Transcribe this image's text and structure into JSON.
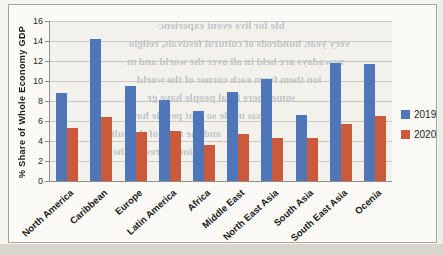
{
  "page": {
    "background": "#f6f4ef",
    "bottom_strip_color": "#d8d5cf",
    "card_background": "#fbfaf6",
    "card_border_color": "#a5a39b"
  },
  "chart_data": {
    "type": "bar",
    "title": "",
    "ylabel": "% Share  of  Whole Economy  GDP",
    "xlabel": "",
    "ylim": [
      0,
      16
    ],
    "yticks": [
      0,
      2,
      4,
      6,
      8,
      10,
      12,
      14,
      16
    ],
    "grid": true,
    "legend_position": "right",
    "categories": [
      "North America",
      "Caribbean",
      "Europe",
      "Latin America",
      "Africa",
      "Middle East",
      "North East Asia",
      "South Asia",
      "South East Asia",
      "Ocenia"
    ],
    "series": [
      {
        "name": "2019",
        "color": "#4f76b8",
        "values": [
          8.8,
          14.2,
          9.5,
          8.1,
          7.0,
          8.9,
          10.2,
          6.6,
          11.8,
          11.7
        ]
      },
      {
        "name": "2020",
        "color": "#cb5a3c",
        "values": [
          5.3,
          6.4,
          4.9,
          5.0,
          3.6,
          4.7,
          4.3,
          4.3,
          5.7,
          6.5
        ]
      }
    ],
    "colors": {
      "gridline": "#c9c7c0",
      "axis": "#8f8d86",
      "series_2019": "#4f76b8",
      "series_2020": "#cb5a3c"
    }
  },
  "legend": {
    "items": [
      {
        "label": "2019",
        "color": "#4f76b8"
      },
      {
        "label": "2020",
        "color": "#cb5a3c"
      }
    ]
  },
  "bleed_text": {
    "lines": [
      {
        "text": "ble for live event experienc",
        "top": 14,
        "left": 150
      },
      {
        "text": "very year, hundreds of cultural festivals, religio",
        "top": 32,
        "left": 120
      },
      {
        "text": "nowadays are held in all over the world and m",
        "top": 50,
        "left": 118
      },
      {
        "text": "ion them from each corner of the world",
        "top": 68,
        "left": 128
      },
      {
        "text": "somewhere local people have gr",
        "top": 86,
        "left": 138
      },
      {
        "text": "has made so that people have",
        "top": 104,
        "left": 118
      },
      {
        "text": "and the most of the cultu",
        "top": 122,
        "left": 96
      },
      {
        "text": "of him the rest of the",
        "top": 140,
        "left": 104
      }
    ]
  }
}
